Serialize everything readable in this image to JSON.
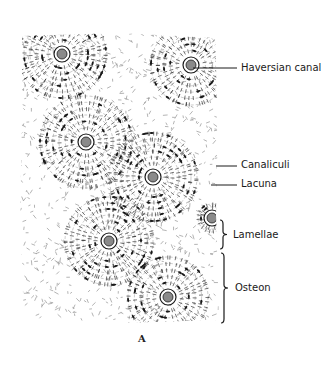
{
  "figure": {
    "caption": "A",
    "labels": [
      {
        "id": "haversian-canal",
        "text": "Haversian canal",
        "x": 241,
        "y": 62,
        "leader": {
          "type": "line",
          "x1": 193,
          "y1": 68,
          "x2": 237,
          "y2": 68
        }
      },
      {
        "id": "canaliculi",
        "text": "Canaliculi",
        "x": 241,
        "y": 159,
        "leader": {
          "type": "line",
          "x1": 216,
          "y1": 166,
          "x2": 237,
          "y2": 166
        }
      },
      {
        "id": "lacuna",
        "text": "Lacuna",
        "x": 241,
        "y": 178,
        "leader": {
          "type": "line",
          "x1": 211,
          "y1": 185,
          "x2": 237,
          "y2": 185
        }
      },
      {
        "id": "lamellae",
        "text": "Lamellae",
        "x": 233,
        "y": 229,
        "leader": {
          "type": "brace",
          "x": 223,
          "y1": 220,
          "y2": 249
        }
      },
      {
        "id": "osteon",
        "text": "Osteon",
        "x": 235,
        "y": 282,
        "leader": {
          "type": "brace",
          "x": 224,
          "y1": 253,
          "y2": 323
        }
      }
    ],
    "osteons": [
      {
        "cx": 62,
        "cy": 54,
        "r": 44
      },
      {
        "cx": 191,
        "cy": 65,
        "r": 40
      },
      {
        "cx": 86,
        "cy": 142,
        "r": 46
      },
      {
        "cx": 153,
        "cy": 177,
        "r": 44
      },
      {
        "cx": 109,
        "cy": 241,
        "r": 44
      },
      {
        "cx": 168,
        "cy": 297,
        "r": 40
      },
      {
        "cx": 212,
        "cy": 218,
        "r": 14
      }
    ],
    "colors": {
      "ink": "#1a1a1a",
      "canal_fill": "#8a8a8a",
      "paper": "#ffffff"
    }
  }
}
